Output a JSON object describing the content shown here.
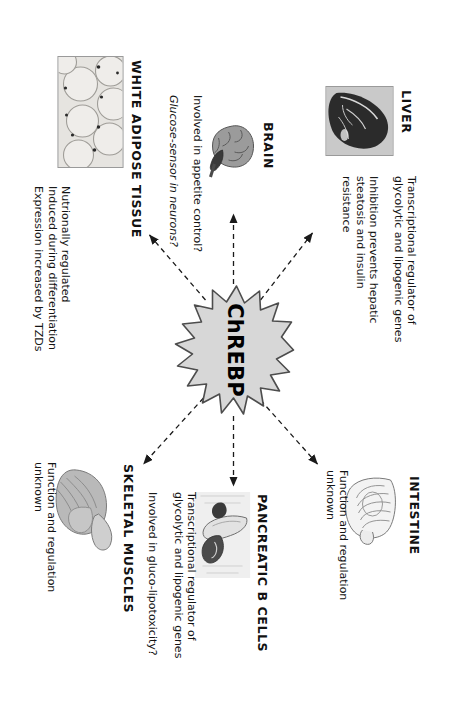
{
  "figure": {
    "center": {
      "label": "ChREBP",
      "shape": "starburst",
      "fill": "#d7d7d7",
      "stroke": "#4d4d4d"
    },
    "organs": [
      {
        "id": "liver",
        "label": "LIVER",
        "artwork": "liver-photo",
        "notes": [
          {
            "text": "Transcriptional regulator of\nglycolytic and lipogenic genes",
            "style": "normal"
          },
          {
            "text": "Inhibition prevents hepatic\nsteatosis and insulin resistance",
            "style": "normal"
          }
        ]
      },
      {
        "id": "intestine",
        "label": "INTESTINE",
        "artwork": "intestine-drawing",
        "notes": [
          {
            "text": "Function and regulation\nunknown",
            "style": "normal"
          }
        ]
      },
      {
        "id": "brain",
        "label": "BRAIN",
        "artwork": "brain-drawing",
        "notes": [
          {
            "text": "Involved in appetite control?",
            "style": "normal"
          },
          {
            "text": "Glucose-sensor in neurons?",
            "style": "italic"
          }
        ]
      },
      {
        "id": "pancreatic-b-cells",
        "label": "PANCREATIC B CELLS",
        "artwork": "pancreas-photo",
        "notes": [
          {
            "text": "Transcriptional regulator of\nglycolytic and lipogenic genes",
            "style": "normal"
          },
          {
            "text": "Involved in gluco-lipotoxicity?",
            "style": "normal"
          }
        ]
      },
      {
        "id": "white-adipose-tissue",
        "label": "WHITE ADIPOSE TISSUE",
        "artwork": "adipocyte-micrograph",
        "notes": [
          {
            "text": "Nutrionally regulated\nInduced during differentiation\nExpression increased by TZDs",
            "style": "normal"
          }
        ]
      },
      {
        "id": "skeletal-muscles",
        "label": "SKELETAL MUSCLES",
        "artwork": "muscle-drawing",
        "notes": [
          {
            "text": "Function and regulation\nunknown",
            "style": "normal"
          }
        ]
      }
    ],
    "arrows": [
      {
        "id": "arrow-to-liver",
        "from": "center",
        "to": "liver",
        "style": "dashed"
      },
      {
        "id": "arrow-to-intestine",
        "from": "center",
        "to": "intestine",
        "style": "dashed"
      },
      {
        "id": "arrow-to-brain",
        "from": "center",
        "to": "brain",
        "style": "dashed"
      },
      {
        "id": "arrow-to-pancreatic-b-cells",
        "from": "center",
        "to": "pancreatic-b-cells",
        "style": "dashed"
      },
      {
        "id": "arrow-to-white-adipose-tissue",
        "from": "center",
        "to": "white-adipose-tissue",
        "style": "dashed"
      },
      {
        "id": "arrow-to-skeletal-muscles",
        "from": "center",
        "to": "skeletal-muscles",
        "style": "dashed"
      }
    ]
  }
}
